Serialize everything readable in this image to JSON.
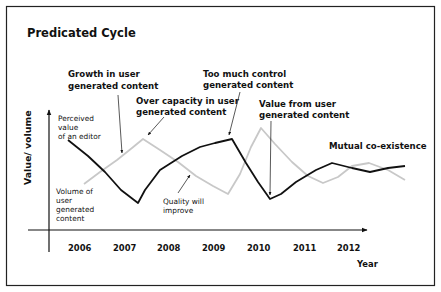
{
  "chart_data": {
    "type": "line",
    "title": "Predicated Cycle",
    "xlabel": "Year",
    "ylabel": "Value/ volume",
    "categories": [
      "2006",
      "2007",
      "2008",
      "2009",
      "2010",
      "2011",
      "2012"
    ],
    "grid": false,
    "series": [
      {
        "name": "Perceived value of an editor",
        "color": "#111111",
        "label_lines": [
          "Perceived",
          "value",
          "of an editor"
        ],
        "points": [
          [
            68,
            140
          ],
          [
            88,
            156
          ],
          [
            105,
            172
          ],
          [
            121,
            190
          ],
          [
            138,
            203
          ],
          [
            145,
            190
          ],
          [
            160,
            170
          ],
          [
            182,
            156
          ],
          [
            200,
            147
          ],
          [
            215,
            143
          ],
          [
            232,
            139
          ],
          [
            246,
            163
          ],
          [
            258,
            182
          ],
          [
            270,
            199
          ],
          [
            281,
            194
          ],
          [
            296,
            182
          ],
          [
            316,
            170
          ],
          [
            332,
            163
          ],
          [
            352,
            168
          ],
          [
            370,
            172
          ],
          [
            388,
            168
          ],
          [
            405,
            166
          ]
        ]
      },
      {
        "name": "Volume of user generated content",
        "color": "#c8c8c8",
        "label_lines": [
          "Volume of",
          "user",
          "generated",
          "content"
        ],
        "points": [
          [
            84,
            184
          ],
          [
            100,
            172
          ],
          [
            117,
            160
          ],
          [
            132,
            148
          ],
          [
            143,
            139
          ],
          [
            160,
            150
          ],
          [
            178,
            162
          ],
          [
            196,
            176
          ],
          [
            213,
            186
          ],
          [
            228,
            194
          ],
          [
            240,
            174
          ],
          [
            251,
            147
          ],
          [
            261,
            128
          ],
          [
            275,
            144
          ],
          [
            292,
            162
          ],
          [
            308,
            176
          ],
          [
            323,
            183
          ],
          [
            338,
            177
          ],
          [
            352,
            166
          ],
          [
            369,
            163
          ],
          [
            388,
            170
          ],
          [
            405,
            180
          ]
        ]
      }
    ],
    "annotations": [
      {
        "lines": [
          "Growth in user",
          "generated content"
        ],
        "arrow_from": [
          118,
          95
        ],
        "arrow_to": [
          122,
          153
        ]
      },
      {
        "lines": [
          "Over capacity in user",
          "generated content"
        ],
        "arrow_from": [
          164,
          117
        ],
        "arrow_to": [
          148,
          136
        ]
      },
      {
        "lines": [
          "Too much control",
          "generated content"
        ],
        "arrow_from": [
          240,
          93
        ],
        "arrow_to": [
          228,
          135
        ]
      },
      {
        "lines": [
          "Value from user",
          "generated content"
        ],
        "arrow_from": [
          271,
          121
        ],
        "arrow_to": [
          270,
          195
        ]
      },
      {
        "lines": [
          "Mutual co-existence"
        ]
      },
      {
        "lines": [
          "Quality will",
          "improve"
        ],
        "arrow_from": [
          178,
          192
        ],
        "arrow_to": [
          190,
          174
        ]
      }
    ]
  },
  "diagram": {
    "title": "Predicated Cycle",
    "y_axis_label": "Value/ volume",
    "x_axis_label": "Year",
    "years": [
      "2006",
      "2007",
      "2008",
      "2009",
      "2010",
      "2011",
      "2012"
    ],
    "labels": {
      "growth": [
        "Growth in user",
        "generated content"
      ],
      "over_capacity": [
        "Over capacity in user",
        "generated content"
      ],
      "too_much_control": [
        "Too much control",
        "generated content"
      ],
      "value_from_ugc": [
        "Value from user",
        "generated content"
      ],
      "mutual": "Mutual co-existence",
      "perceived": [
        "Perceived",
        "value",
        "of an editor"
      ],
      "volume": [
        "Volume of",
        "user",
        "generated",
        "content"
      ],
      "quality": [
        "Quality will",
        "improve"
      ]
    }
  }
}
